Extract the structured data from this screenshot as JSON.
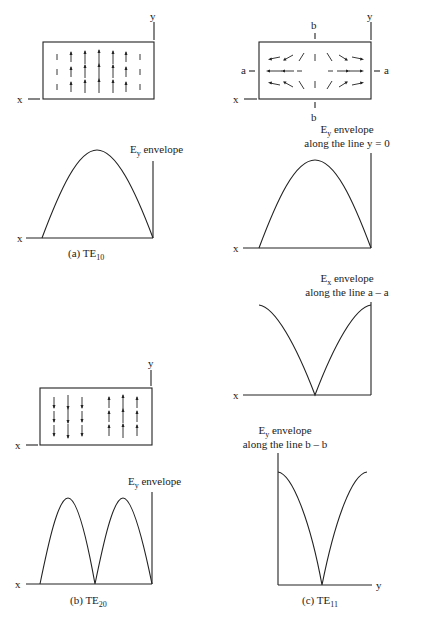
{
  "panel_a": {
    "caption_prefix": "(a) TE",
    "caption_sub": "10",
    "axis_x": "x",
    "axis_y": "y",
    "envelope_label_main": "E",
    "envelope_label_sub": "y",
    "envelope_label_rest": " envelope"
  },
  "panel_b": {
    "caption_prefix": "(b) TE",
    "caption_sub": "20",
    "axis_x": "x",
    "axis_y": "y",
    "envelope_label_main": "E",
    "envelope_label_sub": "y",
    "envelope_label_rest": " envelope"
  },
  "panel_c": {
    "caption_prefix": "(c) TE",
    "caption_sub": "11",
    "axis_x": "x",
    "axis_y": "y",
    "line_a": "a",
    "line_b": "b",
    "env1_main": "E",
    "env1_sub": "y",
    "env1_rest": " envelope",
    "env1_line2": "along the line  y = 0",
    "env2_main": "E",
    "env2_sub": "x",
    "env2_rest": " envelope",
    "env2_line2": "along the line a – a",
    "env3_main": "E",
    "env3_sub": "y",
    "env3_rest": " envelope",
    "env3_line2": "along the line b – b",
    "env3_axis": "y"
  }
}
